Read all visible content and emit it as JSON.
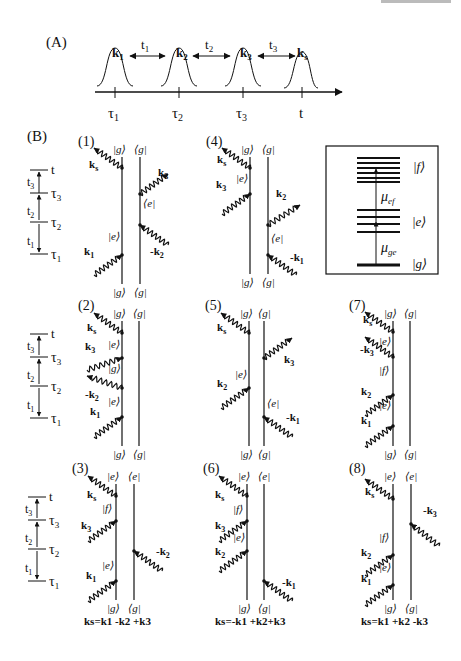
{
  "header_fragment": "",
  "panelA": {
    "label": "(A)",
    "pulses": [
      {
        "label": "k",
        "sub": "1",
        "time": "τ",
        "time_sub": "1",
        "x": 115
      },
      {
        "label": "k",
        "sub": "2",
        "time": "τ",
        "time_sub": "2",
        "x": 179
      },
      {
        "label": "k",
        "sub": "3",
        "time": "τ",
        "time_sub": "3",
        "x": 243
      },
      {
        "label": "k",
        "sub": "s",
        "time": "t",
        "time_sub": "",
        "x": 301
      }
    ],
    "intervals": [
      {
        "label": "t",
        "sub": "1"
      },
      {
        "label": "t",
        "sub": "2"
      },
      {
        "label": "t",
        "sub": "3"
      }
    ]
  },
  "panelB": {
    "label": "(B)",
    "timeline": {
      "labels": [
        {
          "t": "t",
          "sub": ""
        },
        {
          "t": "τ",
          "sub": "3"
        },
        {
          "t": "τ",
          "sub": "2"
        },
        {
          "t": "τ",
          "sub": "1"
        }
      ],
      "intervals": [
        {
          "t": "t",
          "sub": "3"
        },
        {
          "t": "t",
          "sub": "2"
        },
        {
          "t": "t",
          "sub": "1"
        }
      ]
    },
    "diagrams": [
      {
        "id": "(1)",
        "top_ket": "|g⟩",
        "top_bra": "⟨g|",
        "bot_ket": "|g⟩",
        "bot_bra": "⟨g|",
        "ket_states": [
          "|e⟩"
        ],
        "bra_states": [
          "⟨e|"
        ],
        "ket_fields": [
          "k1",
          "ks"
        ],
        "bra_fields": [
          "-k2",
          "k3"
        ]
      },
      {
        "id": "(2)",
        "top_ket": "|g⟩",
        "top_bra": "⟨g|",
        "bot_ket": "|g⟩",
        "bot_bra": "⟨g|",
        "ket_states": [
          "|e⟩",
          "|g⟩",
          "|e⟩"
        ],
        "bra_states": [],
        "ket_fields": [
          "k1",
          "-k2",
          "k3",
          "ks"
        ],
        "bra_fields": []
      },
      {
        "id": "(3)",
        "top_ket": "|e⟩",
        "top_bra": "⟨e|",
        "bot_ket": "|g⟩",
        "bot_bra": "⟨g|",
        "ket_states": [
          "|e⟩",
          "|f⟩"
        ],
        "bra_states": [],
        "ket_fields": [
          "k1",
          "k3",
          "ks"
        ],
        "bra_fields": [
          "-k2"
        ],
        "formula": "ks=k1 -k2 +k3"
      },
      {
        "id": "(4)",
        "top_ket": "|g⟩",
        "top_bra": "⟨g|",
        "bot_ket": "|g⟩",
        "bot_bra": "⟨g|",
        "ket_states": [
          "|e⟩"
        ],
        "bra_states": [
          "⟨e|"
        ],
        "ket_fields": [
          "k3",
          "ks"
        ],
        "bra_fields": [
          "-k1",
          "k2"
        ]
      },
      {
        "id": "(5)",
        "top_ket": "|g⟩",
        "top_bra": "⟨g|",
        "bot_ket": "|g⟩",
        "bot_bra": "⟨g|",
        "ket_states": [
          "|e⟩"
        ],
        "bra_states": [
          "⟨e|"
        ],
        "ket_fields": [
          "k2",
          "ks"
        ],
        "bra_fields": [
          "-k1",
          "k3"
        ]
      },
      {
        "id": "(6)",
        "top_ket": "|e⟩",
        "top_bra": "⟨e|",
        "bot_ket": "|g⟩",
        "bot_bra": "⟨g|",
        "ket_states": [
          "|e⟩",
          "|f⟩"
        ],
        "bra_states": [],
        "ket_fields": [
          "k2",
          "k3",
          "ks"
        ],
        "bra_fields": [
          "-k1"
        ],
        "formula": "ks=-k1 +k2+k3"
      },
      {
        "id": "(7)",
        "top_ket": "|g⟩",
        "top_bra": "⟨g|",
        "bot_ket": "|g⟩",
        "bot_bra": "⟨g|",
        "ket_states": [
          "|e⟩",
          "|f⟩",
          "|e⟩"
        ],
        "bra_states": [],
        "ket_fields": [
          "k1",
          "k2",
          "-k3",
          "ks"
        ],
        "bra_fields": []
      },
      {
        "id": "(8)",
        "top_ket": "|e⟩",
        "top_bra": "⟨e|",
        "bot_ket": "|g⟩",
        "bot_bra": "⟨g|",
        "ket_states": [
          "|e⟩",
          "|f⟩"
        ],
        "bra_states": [],
        "ket_fields": [
          "k1",
          "k2",
          "ks"
        ],
        "bra_fields": [
          "-k3"
        ],
        "formula": "ks=k1 +k2 -k3"
      }
    ],
    "level_scheme": {
      "levels": [
        "|f⟩",
        "|e⟩",
        "|g⟩"
      ],
      "transitions": [
        {
          "label": "μ",
          "sub": "ef"
        },
        {
          "label": "μ",
          "sub": "ge"
        }
      ]
    }
  }
}
